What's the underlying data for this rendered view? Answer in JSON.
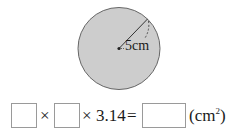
{
  "figure": {
    "shape": "circle",
    "fill_color": "#cdcdcd",
    "stroke_color": "#666666",
    "radius_label": "5cm"
  },
  "equation": {
    "blank_1": "",
    "times_1": "×",
    "blank_2": "",
    "times_2": "×",
    "constant": "3.14",
    "equals": "=",
    "blank_result": "",
    "unit_open": "(cm",
    "unit_exp": "2",
    "unit_close": ")"
  }
}
